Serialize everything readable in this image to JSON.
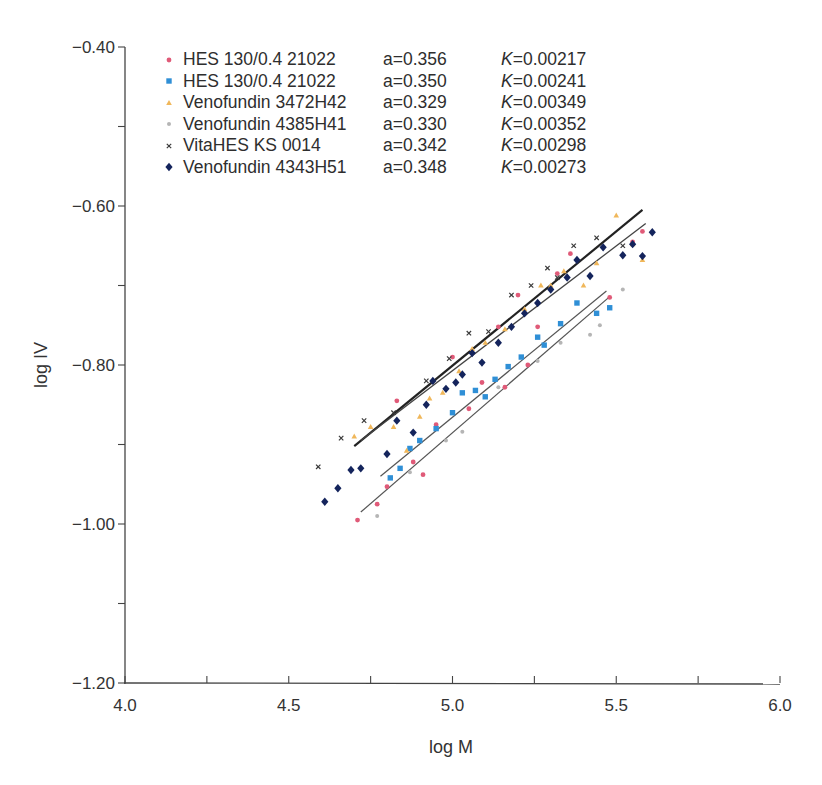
{
  "chart_data": {
    "type": "scatter",
    "title": "",
    "xlabel": "log M",
    "ylabel": "log IV",
    "xlim": [
      4.0,
      6.0
    ],
    "ylim": [
      -1.2,
      -0.4
    ],
    "x_ticks": [
      "4.0",
      "4.5",
      "5.0",
      "5.5",
      "6.0"
    ],
    "y_ticks": [
      "-0.40",
      "-0.60",
      "-0.80",
      "-1.00",
      "-1.20"
    ],
    "grid": false,
    "legend_position": "upper-left",
    "series": [
      {
        "name": "HES 130/0.4 21022",
        "a": "a=0.356",
        "K": "0.00217",
        "color": "#e05a78",
        "marker": "circle",
        "points": [
          [
            4.71,
            -0.995
          ],
          [
            4.77,
            -0.975
          ],
          [
            4.8,
            -0.953
          ],
          [
            4.83,
            -0.845
          ],
          [
            4.88,
            -0.922
          ],
          [
            4.91,
            -0.938
          ],
          [
            4.95,
            -0.875
          ],
          [
            5.0,
            -0.79
          ],
          [
            5.05,
            -0.855
          ],
          [
            5.09,
            -0.822
          ],
          [
            5.14,
            -0.752
          ],
          [
            5.16,
            -0.828
          ],
          [
            5.2,
            -0.712
          ],
          [
            5.23,
            -0.8
          ],
          [
            5.26,
            -0.752
          ],
          [
            5.32,
            -0.685
          ],
          [
            5.36,
            -0.66
          ],
          [
            5.48,
            -0.715
          ],
          [
            5.55,
            -0.645
          ],
          [
            5.58,
            -0.632
          ]
        ]
      },
      {
        "name": "HES 130/0.4 21022",
        "a": "a=0.350",
        "K": "0.00241",
        "color": "#2f8fd6",
        "marker": "square",
        "points": [
          [
            4.81,
            -0.942
          ],
          [
            4.84,
            -0.93
          ],
          [
            4.87,
            -0.905
          ],
          [
            4.9,
            -0.895
          ],
          [
            4.95,
            -0.88
          ],
          [
            5.0,
            -0.86
          ],
          [
            5.03,
            -0.835
          ],
          [
            5.07,
            -0.832
          ],
          [
            5.1,
            -0.84
          ],
          [
            5.13,
            -0.818
          ],
          [
            5.17,
            -0.802
          ],
          [
            5.21,
            -0.79
          ],
          [
            5.26,
            -0.765
          ],
          [
            5.28,
            -0.775
          ],
          [
            5.33,
            -0.748
          ],
          [
            5.38,
            -0.722
          ],
          [
            5.44,
            -0.735
          ],
          [
            5.48,
            -0.728
          ]
        ]
      },
      {
        "name": "Venofundin 3472H42",
        "a": "a=0.329",
        "K": "0.00349",
        "color": "#f0b75a",
        "marker": "triangle",
        "points": [
          [
            4.7,
            -0.89
          ],
          [
            4.75,
            -0.878
          ],
          [
            4.82,
            -0.878
          ],
          [
            4.86,
            -0.908
          ],
          [
            4.9,
            -0.865
          ],
          [
            4.93,
            -0.842
          ],
          [
            4.97,
            -0.835
          ],
          [
            5.02,
            -0.808
          ],
          [
            5.06,
            -0.78
          ],
          [
            5.1,
            -0.772
          ],
          [
            5.16,
            -0.755
          ],
          [
            5.22,
            -0.73
          ],
          [
            5.27,
            -0.7
          ],
          [
            5.3,
            -0.7
          ],
          [
            5.34,
            -0.682
          ],
          [
            5.4,
            -0.7
          ],
          [
            5.44,
            -0.672
          ],
          [
            5.5,
            -0.612
          ],
          [
            5.55,
            -0.648
          ],
          [
            5.58,
            -0.668
          ]
        ]
      },
      {
        "name": "Venofundin 4385H41",
        "a": "a=0.330",
        "K": "0.00352",
        "color": "#b5b5b5",
        "marker": "circle-small",
        "points": [
          [
            4.77,
            -0.99
          ],
          [
            4.87,
            -0.935
          ],
          [
            4.98,
            -0.895
          ],
          [
            5.03,
            -0.884
          ],
          [
            5.14,
            -0.828
          ],
          [
            5.26,
            -0.795
          ],
          [
            5.33,
            -0.772
          ],
          [
            5.42,
            -0.762
          ],
          [
            5.45,
            -0.75
          ],
          [
            5.52,
            -0.705
          ]
        ]
      },
      {
        "name": "VitaHES KS 0014",
        "a": "a=0.342",
        "K": "0.00298",
        "color": "#3a3a3a",
        "marker": "x",
        "points": [
          [
            4.59,
            -0.928
          ],
          [
            4.66,
            -0.892
          ],
          [
            4.73,
            -0.87
          ],
          [
            4.82,
            -0.86
          ],
          [
            4.92,
            -0.82
          ],
          [
            4.99,
            -0.792
          ],
          [
            5.05,
            -0.76
          ],
          [
            5.11,
            -0.758
          ],
          [
            5.18,
            -0.712
          ],
          [
            5.24,
            -0.7
          ],
          [
            5.29,
            -0.678
          ],
          [
            5.32,
            -0.69
          ],
          [
            5.37,
            -0.65
          ],
          [
            5.44,
            -0.64
          ],
          [
            5.52,
            -0.65
          ]
        ]
      },
      {
        "name": "Venofundin 4343H51",
        "a": "a=0.348",
        "K": "0.00273",
        "color": "#14245c",
        "marker": "diamond",
        "points": [
          [
            4.61,
            -0.972
          ],
          [
            4.65,
            -0.955
          ],
          [
            4.69,
            -0.932
          ],
          [
            4.72,
            -0.93
          ],
          [
            4.8,
            -0.912
          ],
          [
            4.83,
            -0.87
          ],
          [
            4.88,
            -0.885
          ],
          [
            4.92,
            -0.85
          ],
          [
            4.94,
            -0.82
          ],
          [
            4.98,
            -0.83
          ],
          [
            5.01,
            -0.822
          ],
          [
            5.03,
            -0.812
          ],
          [
            5.06,
            -0.785
          ],
          [
            5.09,
            -0.797
          ],
          [
            5.14,
            -0.772
          ],
          [
            5.18,
            -0.752
          ],
          [
            5.22,
            -0.735
          ],
          [
            5.26,
            -0.722
          ],
          [
            5.3,
            -0.705
          ],
          [
            5.35,
            -0.69
          ],
          [
            5.38,
            -0.668
          ],
          [
            5.42,
            -0.688
          ],
          [
            5.46,
            -0.652
          ],
          [
            5.52,
            -0.662
          ],
          [
            5.55,
            -0.648
          ],
          [
            5.58,
            -0.663
          ],
          [
            5.61,
            -0.633
          ]
        ]
      }
    ],
    "fit_lines": [
      {
        "name": "upper-fit-1",
        "x": [
          4.7,
          5.58
        ],
        "y": [
          -0.902,
          -0.605
        ],
        "color": "#222222",
        "width": 2.2
      },
      {
        "name": "upper-fit-2",
        "x": [
          4.72,
          5.59
        ],
        "y": [
          -0.895,
          -0.622
        ],
        "color": "#444444",
        "width": 1.3
      },
      {
        "name": "lower-fit-1",
        "x": [
          4.78,
          5.47
        ],
        "y": [
          -0.94,
          -0.707
        ],
        "color": "#555555",
        "width": 1.2
      },
      {
        "name": "lower-fit-2",
        "x": [
          4.72,
          5.48
        ],
        "y": [
          -0.985,
          -0.714
        ],
        "color": "#555555",
        "width": 1.2
      }
    ]
  },
  "legend": [
    {
      "name": "HES 130/0.4 21022",
      "a": "a=0.356",
      "k_label": "K",
      "k_value": "=0.00217"
    },
    {
      "name": "HES 130/0.4 21022",
      "a": "a=0.350",
      "k_label": "K",
      "k_value": "=0.00241"
    },
    {
      "name": "Venofundin 3472H42",
      "a": "a=0.329",
      "k_label": "K",
      "k_value": "=0.00349"
    },
    {
      "name": "Venofundin 4385H41",
      "a": "a=0.330",
      "k_label": "K",
      "k_value": "=0.00352"
    },
    {
      "name": "VitaHES KS 0014",
      "a": "a=0.342",
      "k_label": "K",
      "k_value": "=0.00298"
    },
    {
      "name": "Venofundin 4343H51",
      "a": "a=0.348",
      "k_label": "K",
      "k_value": "=0.00273"
    }
  ]
}
